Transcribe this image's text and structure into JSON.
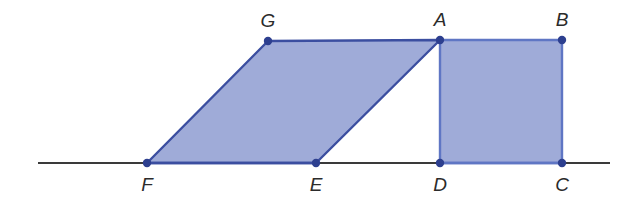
{
  "figure": {
    "canvas": {
      "width": 622,
      "height": 204,
      "background": "#ffffff"
    },
    "colors": {
      "shape_fill": "#9fabd8",
      "shape_stroke": "#3b4ea0",
      "rect_stroke": "#5f76c4",
      "vertex_dot": "#2d3f8f",
      "baseline": "#3a3a3a",
      "label_text": "#2b2b2b"
    },
    "baseline": {
      "name": "horizontal-baseline",
      "x1": 38,
      "y1": 163,
      "x2": 610,
      "y2": 163,
      "stroke_width": 2.2
    },
    "points": [
      {
        "id": "F",
        "label": "F",
        "x": 147,
        "y": 163,
        "label_x": 147,
        "label_y": 191
      },
      {
        "id": "E",
        "label": "E",
        "x": 316,
        "y": 163,
        "label_x": 316,
        "label_y": 191
      },
      {
        "id": "D",
        "label": "D",
        "x": 440,
        "y": 163,
        "label_x": 440,
        "label_y": 191
      },
      {
        "id": "C",
        "label": "C",
        "x": 562,
        "y": 163,
        "label_x": 562,
        "label_y": 191
      },
      {
        "id": "G",
        "label": "G",
        "x": 268,
        "y": 41,
        "label_x": 268,
        "label_y": 27
      },
      {
        "id": "A",
        "label": "A",
        "x": 440,
        "y": 40,
        "label_x": 440,
        "label_y": 26
      },
      {
        "id": "B",
        "label": "B",
        "x": 562,
        "y": 40,
        "label_x": 562,
        "label_y": 26
      }
    ],
    "shapes": [
      {
        "id": "parallelogram-FEAG",
        "label": "Parallelogram F E A G",
        "vertices": "F,E,A,G",
        "polygon_points": "147,163 316,163 440,40 268,41",
        "fill": "#9fabd8",
        "stroke": "#3b4ea0",
        "stroke_width": 2.4
      },
      {
        "id": "rectangle-DCBA",
        "label": "Rectangle D C B A",
        "vertices": "D,C,B,A",
        "polygon_points": "440,163 562,163 562,40 440,40",
        "fill": "#9fabd8",
        "stroke": "#5f76c4",
        "stroke_width": 2.4
      }
    ],
    "vertex_dot_radius": 4.2
  }
}
